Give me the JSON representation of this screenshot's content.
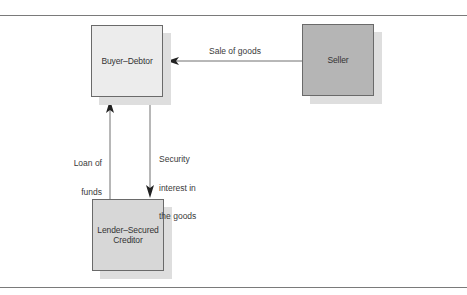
{
  "diagram": {
    "type": "flow",
    "nodes": [
      {
        "id": "buyer",
        "label": "Buyer–Debtor",
        "fill": "#ececec"
      },
      {
        "id": "seller",
        "label": "Seller",
        "fill": "#b5b5b5"
      },
      {
        "id": "lender",
        "label": "Lender–Secured\nCreditor",
        "label_line1": "Lender–Secured",
        "label_line2": "Creditor",
        "fill": "#d7d7d7"
      }
    ],
    "edges": [
      {
        "from": "seller",
        "to": "buyer",
        "label": "Sale of goods"
      },
      {
        "from": "lender",
        "to": "buyer",
        "label": "Loan of\nfunds",
        "label_line1": "Loan of",
        "label_line2": "funds"
      },
      {
        "from": "buyer",
        "to": "lender",
        "label": "Security\ninterest in\nthe goods",
        "label_line1": "Security",
        "label_line2": "interest in",
        "label_line3": "the goods"
      }
    ],
    "colors": {
      "rule": "#7a7a7a",
      "line": "#6e6e6e",
      "shadow": "#dedede",
      "arrowhead": "#222222"
    }
  }
}
